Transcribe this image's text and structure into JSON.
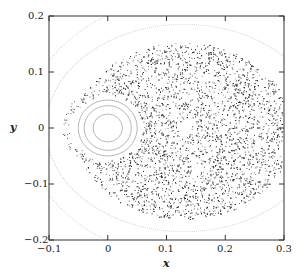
{
  "chart_data": {
    "type": "scatter",
    "title": "",
    "xlabel": "x",
    "ylabel": "y",
    "xlim": [
      -0.1,
      0.3
    ],
    "ylim": [
      -0.2,
      0.2
    ],
    "grid": false,
    "legend": null,
    "xticks": [
      "-0.1",
      "0",
      "0.1",
      "0.2",
      "0.3"
    ],
    "yticks": [
      "0.2",
      "0.1",
      "0",
      "-0.1",
      "-0.2"
    ],
    "series": [
      {
        "name": "island-curves",
        "kind": "closed-curves",
        "center": [
          0.0,
          0.0
        ],
        "radii_x": [
          0.025,
          0.04,
          0.05
        ],
        "radii_y": [
          0.025,
          0.04,
          0.05
        ]
      },
      {
        "name": "chaotic-sea",
        "kind": "scatter",
        "x_range": [
          -0.085,
          0.3
        ],
        "y_range": [
          -0.17,
          0.155
        ],
        "hole_center": [
          0.13,
          0.0
        ],
        "hole_radius": 0.012
      },
      {
        "name": "outer-curves",
        "kind": "dotted-curves",
        "count": 2
      }
    ]
  },
  "axes": {
    "x_label": "x",
    "y_label": "y",
    "x_ticks": [
      "−0.1",
      "0",
      "0.1",
      "0.2",
      "0.3"
    ],
    "y_ticks": [
      "0.2",
      "0.1",
      "0",
      "−0.1",
      "−0.2"
    ]
  }
}
